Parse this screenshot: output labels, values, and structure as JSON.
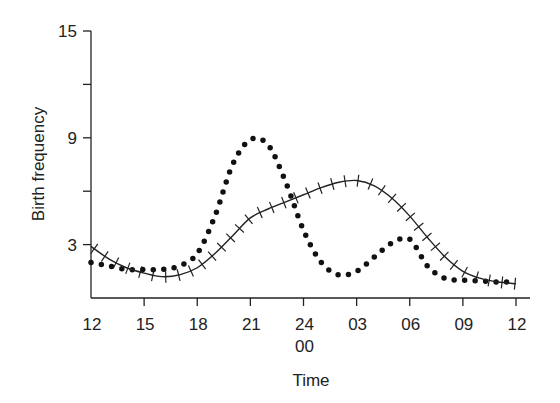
{
  "chart_data": {
    "type": "line",
    "title": "",
    "xlabel": "Time",
    "ylabel": "Birth frequency",
    "ylim": [
      0,
      15
    ],
    "yticks": [
      0,
      3,
      6,
      9,
      12,
      15
    ],
    "ytick_labels": [
      "",
      "3",
      "",
      "9",
      "",
      "15"
    ],
    "xlim_hours": [
      0,
      24
    ],
    "xticks_hours": [
      0,
      3,
      6,
      9,
      12,
      15,
      18,
      21,
      24
    ],
    "xtick_labels": [
      [
        "12"
      ],
      [
        "15"
      ],
      [
        "18"
      ],
      [
        "21"
      ],
      [
        "24",
        "00"
      ],
      [
        "03"
      ],
      [
        "06"
      ],
      [
        "09"
      ],
      [
        "12"
      ]
    ],
    "grid": false,
    "legend": null,
    "series": [
      {
        "name": "dotted",
        "style": "dotted",
        "x": [
          0,
          1,
          2,
          3,
          4,
          5,
          6,
          7,
          8,
          9,
          10,
          11,
          12,
          13,
          14,
          15,
          16,
          17,
          18,
          19,
          20,
          21,
          22,
          23,
          24
        ],
        "y": [
          2.0,
          1.8,
          1.6,
          1.6,
          1.6,
          1.8,
          2.5,
          4.6,
          7.5,
          8.9,
          8.6,
          6.5,
          3.8,
          2.0,
          1.3,
          1.5,
          2.3,
          3.1,
          3.3,
          1.8,
          1.1,
          1.0,
          0.95,
          0.9,
          0.9
        ]
      },
      {
        "name": "solid-crossed",
        "style": "solid-with-ticks",
        "x": [
          0,
          1,
          2,
          3,
          4,
          5,
          6,
          7,
          8,
          9,
          10,
          11,
          12,
          13,
          14,
          15,
          16,
          17,
          18,
          19,
          20,
          21,
          22,
          23,
          24
        ],
        "y": [
          2.9,
          2.2,
          1.7,
          1.4,
          1.2,
          1.3,
          1.7,
          2.5,
          3.5,
          4.5,
          5.0,
          5.4,
          5.8,
          6.2,
          6.5,
          6.6,
          6.3,
          5.6,
          4.6,
          3.4,
          2.3,
          1.5,
          1.1,
          0.9,
          0.8
        ]
      }
    ]
  }
}
